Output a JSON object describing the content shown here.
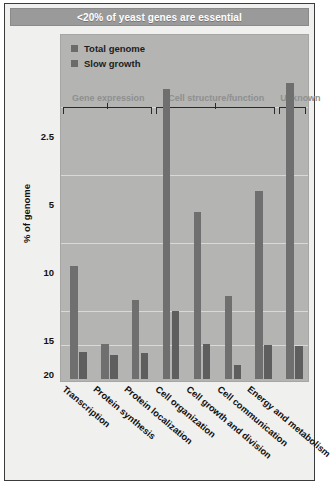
{
  "title": "<20% of yeast genes are essential",
  "legend": {
    "items": [
      {
        "label": "Total genome",
        "color": "#6f6f6f"
      },
      {
        "label": "Slow growth",
        "color": "#5e5e5e"
      }
    ]
  },
  "axis": {
    "ylabel": "% of genome",
    "yticks": [
      "20",
      "15",
      "10",
      "5",
      "2.5"
    ]
  },
  "groups": [
    {
      "label": "Gene expression"
    },
    {
      "label": "Cell structure/function"
    },
    {
      "label": "Unknown"
    }
  ],
  "chart_data": {
    "type": "bar",
    "title": "<20% of yeast genes are essential",
    "xlabel": "",
    "ylabel": "% of genome",
    "ylim": [
      0,
      22.5
    ],
    "grid": true,
    "legend_position": "top-left",
    "ytick_values": [
      2.5,
      5,
      10,
      15,
      20
    ],
    "categories": [
      "Transcription",
      "Protein synthesis",
      "Protein localization",
      "Cell organization",
      "Cell growth and division",
      "Cell communication",
      "Energy and metabolism",
      ""
    ],
    "group_brackets": [
      {
        "label": "Gene expression",
        "categories": [
          "Transcription",
          "Protein synthesis",
          "Protein localization"
        ]
      },
      {
        "label": "Cell structure/function",
        "categories": [
          "Cell organization",
          "Cell growth and division",
          "Cell communication",
          "Energy and metabolism"
        ]
      },
      {
        "label": "Unknown",
        "categories": [
          ""
        ]
      }
    ],
    "series": [
      {
        "name": "Total genome",
        "color": "#6f6f6f",
        "values": [
          8.3,
          2.6,
          5.8,
          21.3,
          12.3,
          6.1,
          13.8,
          21.8
        ]
      },
      {
        "name": "Slow growth",
        "color": "#5e5e5e",
        "values": [
          2.0,
          1.8,
          1.9,
          5.0,
          2.6,
          1.0,
          2.5,
          2.4
        ]
      }
    ]
  }
}
